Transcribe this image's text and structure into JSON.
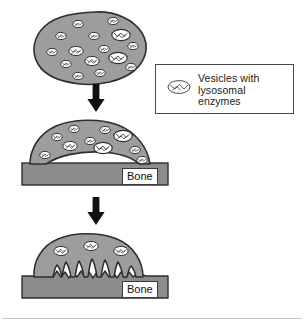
{
  "figure": {
    "background_color": "#ffffff",
    "width": 304,
    "height": 323
  },
  "colors": {
    "cell_fill": "#9d9d9d",
    "cell_outline": "#2e2e2e",
    "bone_fill": "#8c8c8c",
    "bone_outline": "#2e2e2e",
    "vesicle_fill": "#ffffff",
    "vesicle_outline": "#333333",
    "arrow": "#111111",
    "legend_border": "#4a4a4a",
    "text": "#1a1a1a",
    "footer_rule": "#c9c9c9"
  },
  "legend": {
    "icon_name": "vesicle-icon",
    "line1": "Vesicles with",
    "line2": "lysosomal",
    "line3": "enzymes"
  },
  "panels": [
    {
      "id": "panel-top",
      "name": "free-osteoclast-panel",
      "description": "Rounded irregular osteoclast cell filled with many small vesicles",
      "vesicle_count": 14,
      "has_bone": false,
      "has_ruffled_border": false
    },
    {
      "id": "panel-middle",
      "name": "attached-osteoclast-panel",
      "description": "Osteoclast attached to bone surface forming a sealed dome with vesicles migrating toward bone",
      "vesicle_count": 10,
      "has_bone": true,
      "bone_label": "Bone",
      "has_ruffled_border": false
    },
    {
      "id": "panel-bottom",
      "name": "resorbing-osteoclast-panel",
      "description": "Osteoclast with ruffled border projections eroding a resorption pit into the bone",
      "vesicle_count": 3,
      "has_bone": true,
      "bone_label": "Bone",
      "has_ruffled_border": true
    }
  ],
  "arrows": [
    {
      "name": "arrow-top-to-middle",
      "direction": "down"
    },
    {
      "name": "arrow-middle-to-bottom",
      "direction": "down"
    }
  ]
}
